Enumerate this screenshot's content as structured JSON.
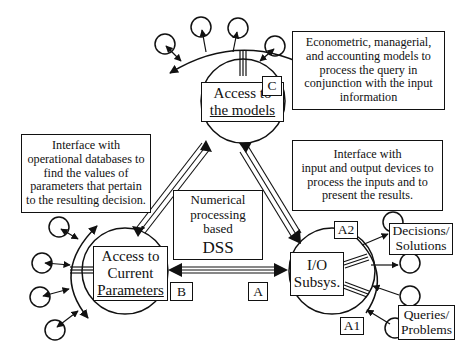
{
  "diagram": {
    "type": "system-architecture",
    "title_center": {
      "lines": [
        "Numerical",
        "processing",
        "based",
        "DSS"
      ]
    },
    "nodes": {
      "models": {
        "lines": [
          "Access to",
          "the models"
        ],
        "tag": "C"
      },
      "parameters": {
        "lines": [
          "Access to",
          "Current",
          "Parameters"
        ],
        "tag": "B"
      },
      "io": {
        "lines": [
          "I/O",
          "Subsys."
        ],
        "tag": "A",
        "tag_output": "A2",
        "tag_input": "A1"
      }
    },
    "descriptions": {
      "models": [
        "Econometric, managerial,",
        "and accounting models to",
        "process the query in",
        "conjunction with the input",
        "information"
      ],
      "parameters": [
        "Interface with",
        "operational databases to",
        "find the values of",
        "parameters that pertain",
        "to the resulting decision."
      ],
      "io": [
        "Interface with",
        "input and output devices to",
        "process the inputs and to",
        "present the results."
      ]
    },
    "io_endpoints": {
      "outputs": [
        "Decisions/",
        "Solutions"
      ],
      "inputs": [
        "Queries/",
        "Problems"
      ]
    },
    "connections": [
      {
        "from": "models",
        "to": "parameters",
        "style": "double-headed triple line"
      },
      {
        "from": "models",
        "to": "io",
        "style": "double-headed triple line"
      },
      {
        "from": "parameters",
        "to": "io",
        "style": "double-headed triple line"
      }
    ],
    "colors": {
      "stroke": "#111111",
      "background": "#ffffff"
    }
  }
}
